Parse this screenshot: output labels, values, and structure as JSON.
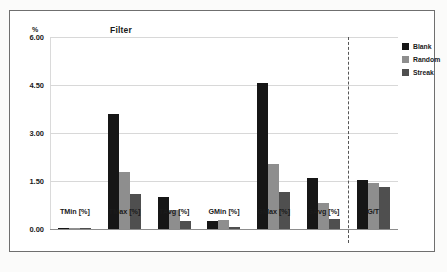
{
  "figure": {
    "title": "Filter",
    "y_axis_unit": "%",
    "legend": [
      {
        "label": "Blank",
        "color": "#161616"
      },
      {
        "label": "Random",
        "color": "#8e8e8e"
      },
      {
        "label": "Streak",
        "color": "#4f4f4f"
      }
    ]
  },
  "chart_data": {
    "type": "bar",
    "title": "Filter",
    "xlabel": "",
    "ylabel": "%",
    "ylim": [
      0,
      6.0
    ],
    "yticks": [
      "0.00",
      "1.50",
      "3.00",
      "4.50",
      "6.00"
    ],
    "ytick_values": [
      0.0,
      1.5,
      3.0,
      4.5,
      6.0
    ],
    "grid": true,
    "legend_position": "right",
    "categories": [
      "TMin [%]",
      "TMax [%]",
      "TAvg [%]",
      "GMin [%]",
      "GMax [%]",
      "GAvg [%]",
      "G/T"
    ],
    "series": [
      {
        "name": "Blank",
        "color": "#161616",
        "values": [
          0.02,
          3.6,
          1.0,
          0.25,
          4.55,
          1.6,
          1.53
        ]
      },
      {
        "name": "Random",
        "color": "#8e8e8e",
        "values": [
          0.01,
          1.78,
          0.58,
          0.28,
          2.02,
          0.8,
          1.45
        ]
      },
      {
        "name": "Streak",
        "color": "#4f4f4f",
        "values": [
          0.01,
          1.1,
          0.25,
          0.07,
          1.15,
          0.32,
          1.32
        ]
      }
    ],
    "annotations": [
      {
        "type": "vertical-dashed-separator",
        "after_category": "GAvg [%]"
      }
    ]
  }
}
